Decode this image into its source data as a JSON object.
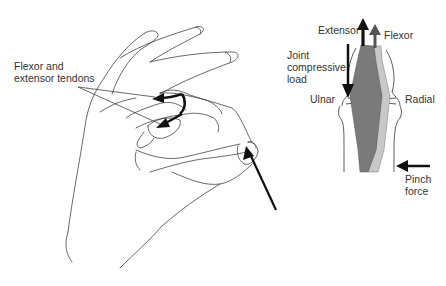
{
  "figure": {
    "left_panel": {
      "title": "Hand pinch grip illustration",
      "labels": {
        "tendons": "Flexor and\nextensor tendons"
      }
    },
    "right_panel": {
      "title": "Finger joint force diagram",
      "labels": {
        "extensor": "Extensor",
        "flexor": "Flexor",
        "joint_load": "Joint\ncompressive\nload",
        "ulnar": "Ulnar",
        "radial": "Radial",
        "pinch_force": "Pinch\nforce"
      },
      "colors": {
        "extensor_band": "#7a7a7a",
        "flexor_band": "#c8c8c8",
        "extensor_arrow": "#111111",
        "flexor_arrow": "#555555",
        "outline": "#333333"
      }
    }
  }
}
